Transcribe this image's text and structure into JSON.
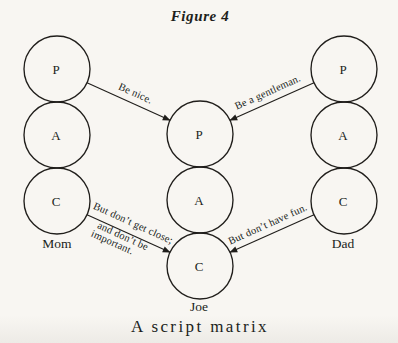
{
  "figure": {
    "title": "Figure 4",
    "caption": "A script matrix"
  },
  "colors": {
    "paper": "#f8f6f2",
    "ink": "#201e1b"
  },
  "columns": {
    "mom": {
      "label": "Mom",
      "ego_states": [
        "P",
        "A",
        "C"
      ]
    },
    "joe": {
      "label": "Joe",
      "ego_states": [
        "P",
        "A",
        "C"
      ]
    },
    "dad": {
      "label": "Dad",
      "ego_states": [
        "P",
        "A",
        "C"
      ]
    }
  },
  "injunctions": {
    "mom_parent_msg": "Be nice.",
    "dad_parent_msg": "Be a gentleman.",
    "mom_child_msg_line1": "But don’t get close;",
    "mom_child_msg_line2": "and don’t be",
    "mom_child_msg_line3": "important.",
    "dad_child_msg": "But don’t have fun."
  }
}
